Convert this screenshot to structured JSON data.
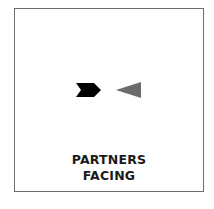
{
  "diagram": {
    "symbols": [
      {
        "name": "black-chevron-arrow-right",
        "direction": "right",
        "color": "#000000"
      },
      {
        "name": "grey-triangle-pointing-left",
        "direction": "left",
        "color": "#6b6b6b"
      }
    ],
    "caption": {
      "line1": "PARTNERS",
      "line2": "FACING"
    },
    "border_color": "#6e6e6e"
  }
}
